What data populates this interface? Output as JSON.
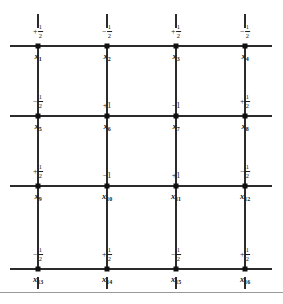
{
  "figure": {
    "columns": 4,
    "rows": 4,
    "nodes": [
      {
        "id": "x1",
        "label": "x",
        "subscript": "1",
        "sign": "+",
        "value": "1/2",
        "numerator": "1",
        "denominator": "2",
        "value_text": "+1/2",
        "row": 1,
        "col": 1
      },
      {
        "id": "x2",
        "label": "x",
        "subscript": "2",
        "sign": "−",
        "value": "1/2",
        "numerator": "1",
        "denominator": "2",
        "value_text": "−1/2",
        "row": 1,
        "col": 2
      },
      {
        "id": "x3",
        "label": "x",
        "subscript": "3",
        "sign": "+",
        "value": "1/2",
        "numerator": "1",
        "denominator": "2",
        "value_text": "+1/2",
        "row": 1,
        "col": 3
      },
      {
        "id": "x4",
        "label": "x",
        "subscript": "4",
        "sign": "−",
        "value": "1/2",
        "numerator": "1",
        "denominator": "2",
        "value_text": "−1/2",
        "row": 1,
        "col": 4
      },
      {
        "id": "x5",
        "label": "x",
        "subscript": "5",
        "sign": "−",
        "value": "1/2",
        "numerator": "1",
        "denominator": "2",
        "value_text": "−1/2",
        "row": 2,
        "col": 1
      },
      {
        "id": "x6",
        "label": "x",
        "subscript": "6",
        "sign": "+",
        "value": "1",
        "numerator": "",
        "denominator": "",
        "value_text": "+1",
        "row": 2,
        "col": 2
      },
      {
        "id": "x7",
        "label": "x",
        "subscript": "7",
        "sign": "−",
        "value": "1",
        "numerator": "",
        "denominator": "",
        "value_text": "−1",
        "row": 2,
        "col": 3
      },
      {
        "id": "x8",
        "label": "x",
        "subscript": "8",
        "sign": "+",
        "value": "1/2",
        "numerator": "1",
        "denominator": "2",
        "value_text": "+1/2",
        "row": 2,
        "col": 4
      },
      {
        "id": "x9",
        "label": "x",
        "subscript": "9",
        "sign": "+",
        "value": "1/2",
        "numerator": "1",
        "denominator": "2",
        "value_text": "+1/2",
        "row": 3,
        "col": 1
      },
      {
        "id": "x10",
        "label": "x",
        "subscript": "10",
        "sign": "−",
        "value": "1",
        "numerator": "",
        "denominator": "",
        "value_text": "−1",
        "row": 3,
        "col": 2
      },
      {
        "id": "x11",
        "label": "x",
        "subscript": "11",
        "sign": "+",
        "value": "1",
        "numerator": "",
        "denominator": "",
        "value_text": "+1",
        "row": 3,
        "col": 3
      },
      {
        "id": "x12",
        "label": "x",
        "subscript": "12",
        "sign": "−",
        "value": "1/2",
        "numerator": "1",
        "denominator": "2",
        "value_text": "−1/2",
        "row": 3,
        "col": 4
      },
      {
        "id": "x13",
        "label": "x",
        "subscript": "13",
        "sign": "−",
        "value": "1/2",
        "numerator": "1",
        "denominator": "2",
        "value_text": "−1/2",
        "row": 4,
        "col": 1
      },
      {
        "id": "x14",
        "label": "x",
        "subscript": "14",
        "sign": "+",
        "value": "1/2",
        "numerator": "1",
        "denominator": "2",
        "value_text": "+1/2",
        "row": 4,
        "col": 2
      },
      {
        "id": "x15",
        "label": "x",
        "subscript": "15",
        "sign": "−",
        "value": "1/2",
        "numerator": "1",
        "denominator": "2",
        "value_text": "−1/2",
        "row": 4,
        "col": 3
      },
      {
        "id": "x16",
        "label": "x",
        "subscript": "16",
        "sign": "+",
        "value": "1/2",
        "numerator": "1",
        "denominator": "2",
        "value_text": "+1/2",
        "row": 4,
        "col": 4
      }
    ],
    "geometry": {
      "col_x": [
        38,
        107,
        176,
        245
      ],
      "row_y": [
        46,
        116,
        186,
        269
      ],
      "line_left": 10,
      "line_right": 272,
      "stub_top_y": 14,
      "stub_bottom_y": 289,
      "stub_length": 14,
      "bottom_rule_y": 292,
      "bottom_rule_width": 283
    },
    "colors": {
      "line": "#2b2b2b",
      "node": "#111111",
      "text": "#1a1a1a",
      "rule": "#9a9a9a",
      "background": "#ffffff"
    }
  }
}
